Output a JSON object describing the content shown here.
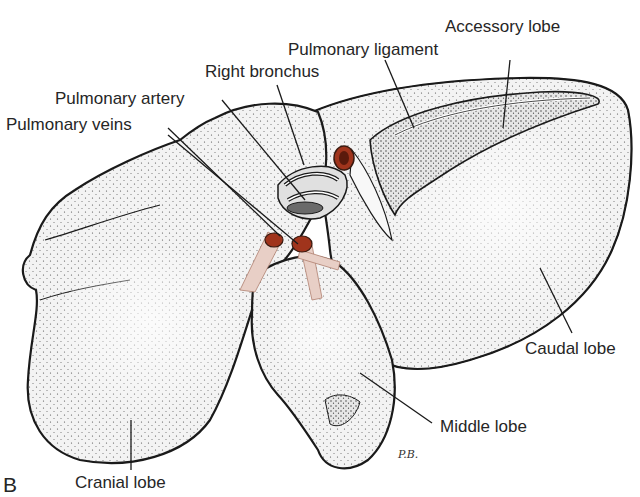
{
  "figure": {
    "panel": "B",
    "signature": "P.B.",
    "colors": {
      "outline": "#1a1a1a",
      "lobe_fill": "#f2f2f2",
      "stipple": "#3a3a3a",
      "vessel_red": "#a0341c",
      "vessel_pink": "#e8cfc6",
      "label_text": "#262626"
    }
  },
  "labels": {
    "accessory_lobe": "Accessory lobe",
    "pulmonary_ligament": "Pulmonary ligament",
    "right_bronchus": "Right bronchus",
    "pulmonary_artery": "Pulmonary artery",
    "pulmonary_veins": "Pulmonary veins",
    "caudal_lobe": "Caudal lobe",
    "middle_lobe": "Middle lobe",
    "cranial_lobe": "Cranial lobe"
  }
}
